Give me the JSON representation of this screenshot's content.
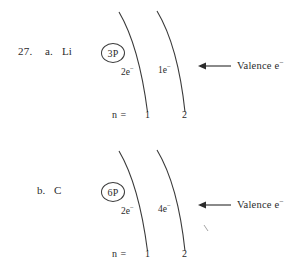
{
  "page": {
    "background_color": "#ffffff",
    "ink_color": "#2b2b2b",
    "width": 304,
    "height": 278
  },
  "problems": [
    {
      "id": "a",
      "question_number": "27.",
      "item_letter": "a.",
      "element_symbol": "Li",
      "nucleus_label": "3P",
      "shells": [
        {
          "n_label": "1",
          "electron_count_label": "2e",
          "electron_charge": "−"
        },
        {
          "n_label": "2",
          "electron_count_label": "1e",
          "electron_charge": "−"
        }
      ],
      "n_prefix": "n =",
      "annotation": {
        "text": "Valence e",
        "charge": "−",
        "arrow": "left-arrow-icon"
      }
    },
    {
      "id": "b",
      "question_number": "",
      "item_letter": "b.",
      "element_symbol": "C",
      "nucleus_label": "6P",
      "shells": [
        {
          "n_label": "1",
          "electron_count_label": "2e",
          "electron_charge": "−"
        },
        {
          "n_label": "2",
          "electron_count_label": "4e",
          "electron_charge": "−"
        }
      ],
      "n_prefix": "n =",
      "annotation": {
        "text": "Valence e",
        "charge": "−",
        "arrow": "left-arrow-icon"
      }
    }
  ]
}
